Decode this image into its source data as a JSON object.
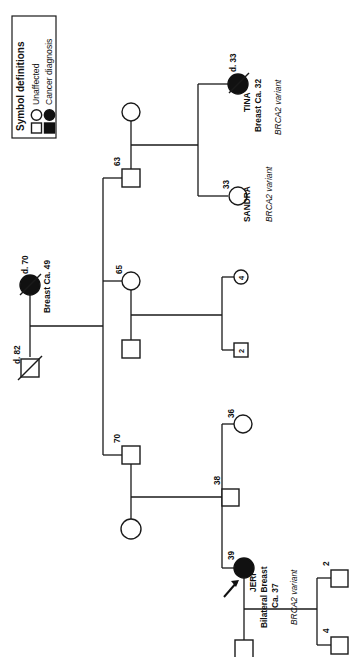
{
  "figure": {
    "kind": "family-pedigree-chart",
    "orientation": "rotated-90-counterclockwise"
  },
  "legend": {
    "title": "Symbol definitions",
    "items": [
      {
        "label": "Unaffected",
        "circle": "open-circle",
        "square": "open-square"
      },
      {
        "label": "Cancer diagnosis",
        "circle": "filled-circle",
        "square": "filled-square"
      }
    ]
  },
  "people": {
    "founder_female": {
      "age_label": "d. 70",
      "diagnosis": "Breast Ca. 49",
      "symbol": "filled-circle",
      "deceased": true
    },
    "founder_male": {
      "age_label": "d. 82",
      "symbol": "open-square",
      "deceased": true
    },
    "son_63": {
      "age_label": "63",
      "symbol": "open-square"
    },
    "spouse_63": {
      "age_label": "",
      "symbol": "open-circle"
    },
    "tina": {
      "age_label": "d. 33",
      "name": "TINA",
      "diagnosis": "Breast Ca. 32",
      "variant": "BRCA2 variant",
      "symbol": "filled-circle",
      "deceased": true
    },
    "sandra": {
      "age_label": "33",
      "name": "SANDRA",
      "variant": "BRCA2 variant",
      "symbol": "open-circle"
    },
    "daughter_65": {
      "age_label": "65",
      "symbol": "open-circle"
    },
    "child_4": {
      "age_label": "4",
      "symbol": "open-circle"
    },
    "child_2": {
      "age_label": "2",
      "symbol": "open-square"
    },
    "child_son_65": {
      "age_label": "",
      "symbol": "open-square"
    },
    "son_70": {
      "age_label": "70",
      "symbol": "open-square"
    },
    "spouse_70": {
      "age_label": "",
      "symbol": "open-circle"
    },
    "daughter_36": {
      "age_label": "36",
      "symbol": "open-circle"
    },
    "son_38": {
      "age_label": "38",
      "symbol": "open-square"
    },
    "jeri": {
      "age_label": "39",
      "name": "JERI",
      "diagnosis_line1": "Bilateral Breast",
      "diagnosis_line2": "Ca. 37",
      "variant": "BRCA2 variant",
      "symbol": "filled-circle",
      "proband": true,
      "proband_marker": "arrow"
    },
    "jeri_child_2": {
      "age_label": "2",
      "symbol": "open-square"
    },
    "jeri_child_4": {
      "age_label": "4",
      "symbol": "open-square"
    },
    "jeri_spouse": {
      "age_label": "",
      "symbol": "open-square"
    }
  },
  "colors": {
    "line": "#1a1a1a",
    "affected_fill": "#111111",
    "unaffected_fill": "#ffffff",
    "background": "#ffffff"
  }
}
